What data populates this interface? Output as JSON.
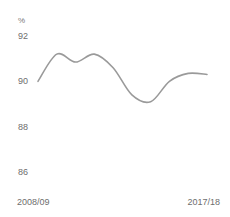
{
  "chart_data": {
    "type": "line",
    "title": "",
    "subtitle": "",
    "unit_label": "%",
    "xlabel": "",
    "ylabel": "",
    "ylim": [
      85.4,
      92.4
    ],
    "yticks": [
      92,
      90,
      88,
      86
    ],
    "ytick_labels": [
      "92",
      "90",
      "88",
      "86"
    ],
    "grid": false,
    "legend": false,
    "x_axis_labels": {
      "first": "2008/09",
      "last": "2017/18"
    },
    "categories": [
      "2008/09",
      "2009/10",
      "2010/11",
      "2011/12",
      "2012/13",
      "2013/14",
      "2014/15",
      "2015/16",
      "2016/17",
      "2017/18"
    ],
    "series": [
      {
        "name": "",
        "color": "#9a9a9a",
        "values": [
          90.0,
          91.2,
          90.85,
          91.2,
          90.6,
          89.4,
          89.1,
          90.0,
          90.35,
          90.3
        ]
      }
    ]
  },
  "axis": {
    "unit": "%",
    "y_labels": [
      "92",
      "90",
      "88",
      "86"
    ],
    "x_label_left": "2008/09",
    "x_label_right": "2017/18"
  },
  "colors": {
    "line": "#9a9a9a",
    "text": "#6e6e6e",
    "background": "#ffffff"
  }
}
